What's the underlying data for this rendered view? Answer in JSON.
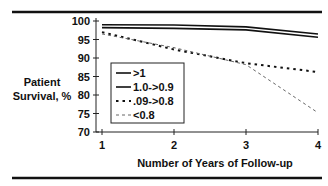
{
  "chart_data": {
    "type": "line",
    "title": "",
    "xlabel": "Number of Years of Follow-up",
    "ylabel": [
      "Patient",
      "Survival, %"
    ],
    "x": [
      1,
      2,
      3,
      4
    ],
    "xticks": [
      "1",
      "2",
      "3",
      "4"
    ],
    "yticks": [
      "100",
      "95",
      "90",
      "85",
      "80",
      "75",
      "70"
    ],
    "ylim": [
      70,
      100
    ],
    "xlim": [
      1,
      4
    ],
    "grid": false,
    "legend_position": "center-left",
    "series": [
      {
        "name": ">1",
        "style": "solid",
        "values": [
          99,
          98.9,
          98.4,
          96.5
        ]
      },
      {
        "name": "1.0->0.9",
        "style": "solid",
        "values": [
          98.2,
          98.0,
          97.6,
          95.6
        ]
      },
      {
        "name": ".09->0.8",
        "style": "dotted",
        "values": [
          97,
          92.3,
          88.6,
          86.2
        ]
      },
      {
        "name": "<0.8",
        "style": "dashed-light",
        "values": [
          96.5,
          92.8,
          88.2,
          75.2
        ]
      }
    ]
  }
}
